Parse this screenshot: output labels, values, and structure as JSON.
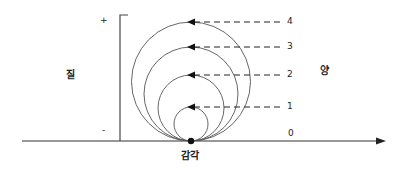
{
  "labels": {
    "left_side": "질",
    "right_side": "양",
    "bottom_center": "감각",
    "plus": "+",
    "minus": "-"
  },
  "levels": [
    {
      "value": "0",
      "y": 141,
      "radius": 0
    },
    {
      "value": "1",
      "y": 107,
      "radius": 17
    },
    {
      "value": "2",
      "y": 75,
      "radius": 33
    },
    {
      "value": "3",
      "y": 47,
      "radius": 47
    },
    {
      "value": "4",
      "y": 22,
      "radius": 59.5
    }
  ],
  "colors": {
    "line": "#333333",
    "circle": "#555555",
    "background": "#ffffff"
  }
}
